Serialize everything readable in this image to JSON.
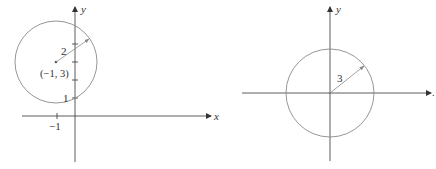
{
  "colors": {
    "axis": "#333333",
    "circle": "#8a8a8a",
    "radius": "#8a8a8a",
    "text": "#333333"
  },
  "diagrams": [
    {
      "id": "left",
      "axes": {
        "x_label": "x",
        "y_label": "y"
      },
      "circle": {
        "center": [
          -1,
          3
        ],
        "radius": 2
      },
      "labels": {
        "radius": "2",
        "center": "(−1, 3)",
        "y_tick_1": "1",
        "x_tick_neg1": "−1"
      },
      "y_ticks": [
        1,
        2,
        3,
        4
      ],
      "x_ticks": [
        -1
      ]
    },
    {
      "id": "right",
      "axes": {
        "x_label": ".",
        "y_label": "y"
      },
      "circle": {
        "center": [
          0,
          0
        ],
        "radius": 3
      },
      "labels": {
        "radius": "3"
      }
    }
  ]
}
